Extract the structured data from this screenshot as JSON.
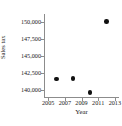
{
  "chart_data": {
    "type": "scatter",
    "title": "",
    "xlabel": "Year",
    "ylabel": "Sales tax",
    "xlim": [
      2004.5,
      2013.5
    ],
    "ylim": [
      138800,
      151200
    ],
    "grid": false,
    "legend": null,
    "x_ticks": [
      "2005",
      "2007",
      "2009",
      "2011",
      "2013"
    ],
    "x_tick_values": [
      2005,
      2007,
      2009,
      2011,
      2013
    ],
    "y_ticks": [
      "150,000",
      "147,500",
      "145,000",
      "142,500",
      "140,000"
    ],
    "y_tick_values": [
      150000,
      147500,
      145000,
      142500,
      140000
    ],
    "points": [
      {
        "x": 2006,
        "y": 141600,
        "label": "2006, 141,600"
      },
      {
        "x": 2008,
        "y": 141700,
        "label": "2008, 141,700"
      },
      {
        "x": 2010,
        "y": 139600,
        "label": "2010, 139,600"
      },
      {
        "x": 2012,
        "y": 150100,
        "label": "2012, 150,100"
      }
    ],
    "marker": "filled-circle",
    "marker_color": "#111111",
    "axis_color": "#8c8c8c",
    "text_color": "#1a1a1a",
    "background": "#ffffff"
  }
}
